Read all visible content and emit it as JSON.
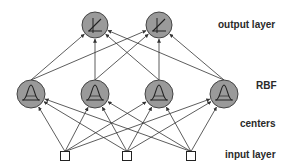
{
  "diagram": {
    "colors": {
      "node_fill": "#9a9a9a",
      "node_stroke": "#444444",
      "edge": "#333333",
      "input_fill": "#ffffff"
    },
    "layers": [
      {
        "id": "output",
        "label": "output layer",
        "node_type": "linear-activation",
        "count": 2
      },
      {
        "id": "rbf",
        "label": "RBF",
        "node_type": "gaussian",
        "count": 4
      },
      {
        "id": "centers",
        "label": "centers",
        "node_type": "edge-annotation"
      },
      {
        "id": "input",
        "label": "input layer",
        "node_type": "square",
        "count": 3
      }
    ],
    "nodes": {
      "output": [
        {
          "x": 95,
          "y": 25
        },
        {
          "x": 159,
          "y": 25
        }
      ],
      "rbf": [
        {
          "x": 31,
          "y": 94
        },
        {
          "x": 95,
          "y": 94
        },
        {
          "x": 159,
          "y": 94
        },
        {
          "x": 224,
          "y": 94
        }
      ],
      "input": [
        {
          "x": 65,
          "y": 156
        },
        {
          "x": 127,
          "y": 156
        },
        {
          "x": 191,
          "y": 156
        }
      ]
    },
    "connections": "fully connected between adjacent layers, arrows point upward"
  }
}
